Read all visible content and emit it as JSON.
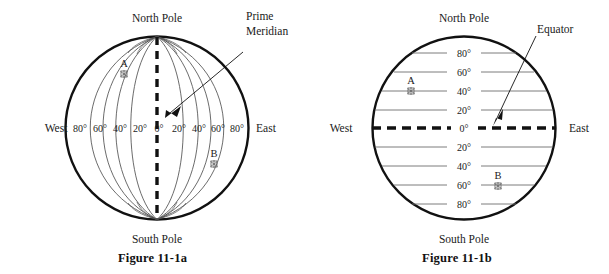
{
  "figures": [
    {
      "id": "figure-a",
      "caption": "Figure 11-1a",
      "type": "longitude-globe",
      "top_label": "North Pole",
      "bottom_label": "South Pole",
      "left_label": "West",
      "right_label": "East",
      "callout": {
        "line1": "Prime",
        "line2": "Meridian"
      },
      "degree_labels": [
        "80°",
        "60°",
        "40°",
        "20°",
        "0°",
        "20°",
        "40°",
        "60°",
        "80°"
      ],
      "points": [
        {
          "label": "A",
          "marker": "star-marker"
        },
        {
          "label": "B",
          "marker": "star-marker"
        }
      ]
    },
    {
      "id": "figure-b",
      "caption": "Figure 11-1b",
      "type": "latitude-globe",
      "top_label": "North Pole",
      "bottom_label": "South Pole",
      "left_label": "West",
      "right_label": "East",
      "callout": {
        "line1": "Equator",
        "line2": ""
      },
      "degree_labels": [
        "80°",
        "60°",
        "40°",
        "20°",
        "0°",
        "20°",
        "40°",
        "60°",
        "80°"
      ],
      "points": [
        {
          "label": "A",
          "marker": "star-marker"
        },
        {
          "label": "B",
          "marker": "star-marker"
        }
      ]
    }
  ],
  "colors": {
    "outline": "#111111",
    "gridline": "#666666",
    "text": "#1a1a1a",
    "background": "#ffffff"
  }
}
